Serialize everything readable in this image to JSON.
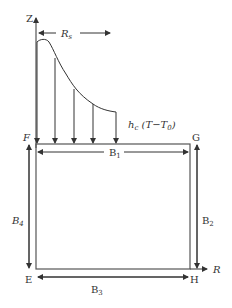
{
  "diagram": {
    "axes": {
      "vertical_label": "Z",
      "horizontal_label": "R"
    },
    "top_dimension": {
      "label_main": "R",
      "label_sub": "s"
    },
    "heat_flux": {
      "label_h": "h",
      "label_h_sub": "c",
      "label_expr_open": " (T−T",
      "label_expr_sub": "0",
      "label_expr_close": ")",
      "arrow_count": 5
    },
    "corners": {
      "top_left": "F",
      "top_right": "G",
      "bottom_left": "E",
      "bottom_right": "H"
    },
    "boundaries": {
      "top": {
        "main": "B",
        "sub": "1"
      },
      "right": {
        "main": "B",
        "sub": "2"
      },
      "bottom": {
        "main": "B",
        "sub": "3"
      },
      "left": {
        "main": "B",
        "sub": "4"
      }
    },
    "colors": {
      "line": "#333333",
      "rect_edge": "#555555",
      "background": "#ffffff"
    }
  }
}
